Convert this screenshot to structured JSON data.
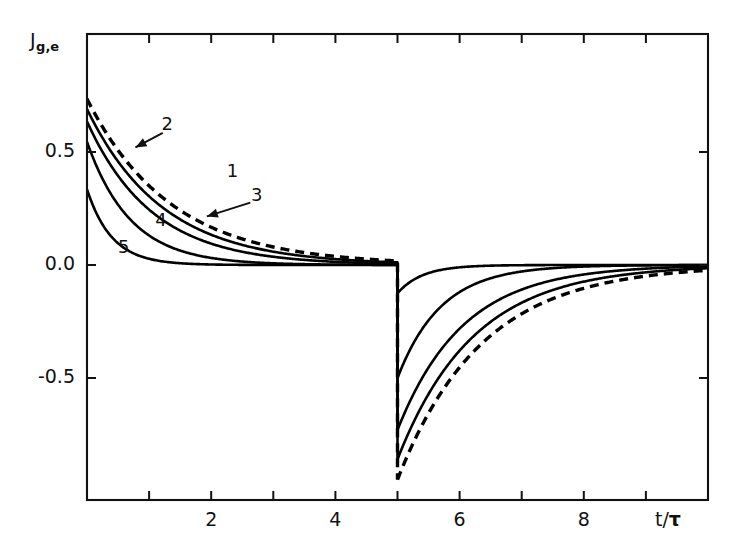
{
  "figure": {
    "axis_labels": {
      "y_main": "J",
      "y_sub": "g,e",
      "x_numerator": "t/",
      "x_denominator": "τ"
    }
  },
  "chart_data": {
    "type": "line",
    "title": "",
    "xlabel": "t/τ",
    "ylabel": "J_{g,e}",
    "xlim": [
      0,
      10
    ],
    "ylim": [
      -0.92,
      0.78
    ],
    "grid": false,
    "legend": "inline-curve-labels",
    "x_ticks_major": [
      2,
      4,
      6,
      8
    ],
    "x_ticks_minor": [
      1,
      3,
      5,
      7,
      9
    ],
    "x_tick_labels": [
      "2",
      "4",
      "6",
      "8"
    ],
    "y_ticks": [
      0.5,
      0.0,
      -0.5
    ],
    "y_tick_labels": [
      "0.5",
      "0.0",
      "-0.5"
    ],
    "switch_time": 5,
    "series": [
      {
        "name": "1",
        "label": "1",
        "style": "dashed",
        "color": "#000000",
        "tau": 1.35,
        "y0": 0.735,
        "y_after_flip": -0.95,
        "label_x": 2.33,
        "label_y": 0.41,
        "arrow": false
      },
      {
        "name": "2",
        "label": "2",
        "style": "solid",
        "color": "#000000",
        "tau": 1.22,
        "y0": 0.69,
        "y_after_flip": -0.86,
        "label_x": 1.28,
        "label_y": 0.62,
        "arrow": true,
        "arrow_from_x": 1.22,
        "arrow_from_y": 0.585,
        "arrow_to_x": 0.78,
        "arrow_to_y": 0.52
      },
      {
        "name": "3",
        "label": "3",
        "style": "solid",
        "color": "#000000",
        "tau": 1.05,
        "y0": 0.635,
        "y_after_flip": -0.73,
        "label_x": 2.72,
        "label_y": 0.305,
        "arrow": true,
        "arrow_from_x": 2.63,
        "arrow_from_y": 0.276,
        "arrow_to_x": 1.93,
        "arrow_to_y": 0.215
      },
      {
        "name": "4",
        "label": "4",
        "style": "solid",
        "color": "#000000",
        "tau": 0.7,
        "y0": 0.545,
        "y_after_flip": -0.5,
        "label_x": 1.18,
        "label_y": 0.195,
        "arrow": false
      },
      {
        "name": "5",
        "label": "5",
        "style": "solid",
        "color": "#000000",
        "tau": 0.4,
        "y0": 0.335,
        "y_after_flip": -0.125,
        "label_x": 0.58,
        "label_y": 0.075,
        "arrow": false
      }
    ]
  }
}
